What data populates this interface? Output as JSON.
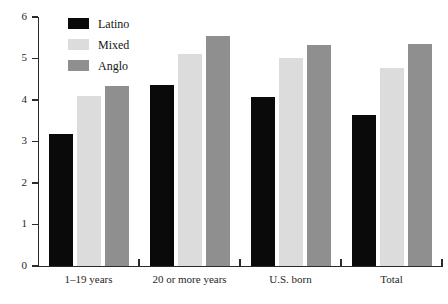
{
  "chart_data": {
    "type": "bar",
    "title": "",
    "subtitle": "",
    "xlabel": "",
    "ylabel": "",
    "categories": [
      "1–19 years",
      "20 or more years",
      "U.S. born",
      "Total"
    ],
    "series": [
      {
        "name": "Latino",
        "color": "#0a0a0a",
        "values": [
          3.17,
          4.35,
          4.08,
          3.65
        ]
      },
      {
        "name": "Mixed",
        "color": "#dcdcdc",
        "values": [
          4.1,
          5.12,
          5.02,
          4.76
        ]
      },
      {
        "name": "Anglo",
        "color": "#8f8f8f",
        "values": [
          4.33,
          5.55,
          5.32,
          5.34
        ]
      }
    ],
    "ylim": [
      0,
      6
    ],
    "yticks": [
      0,
      1,
      2,
      3,
      4,
      5,
      6
    ],
    "ytick_labels": [
      "0",
      "1",
      "2",
      "3",
      "4",
      "5",
      "6"
    ],
    "grid": false,
    "legend_position": "top-left",
    "legend_entries": [
      "Latino",
      "Mixed",
      "Anglo"
    ]
  }
}
